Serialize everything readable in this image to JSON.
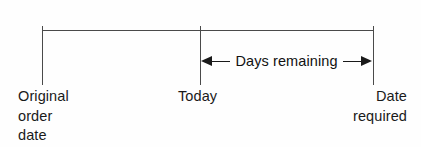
{
  "diagram": {
    "background_color": "#fefefe",
    "line_color": "#4a4a4a",
    "arrow_color": "#1a1a1a",
    "text_color": "#1a1a1a"
  },
  "axis": {
    "orientation": "horizontal",
    "tick_count": 3
  },
  "milestones": [
    {
      "id": "original-order-date",
      "label": "Original\norder\ndate",
      "label_lines": [
        "Original",
        "order",
        "date"
      ],
      "position": "left"
    },
    {
      "id": "today",
      "label": "Today",
      "label_lines": [
        "Today"
      ],
      "position": "middle"
    },
    {
      "id": "date-required",
      "label": "Date\nrequired",
      "label_lines": [
        "Date",
        "required"
      ],
      "position": "right"
    }
  ],
  "span": {
    "label": "Days remaining",
    "from": "today",
    "to": "date-required",
    "arrow_style": "double-headed"
  }
}
